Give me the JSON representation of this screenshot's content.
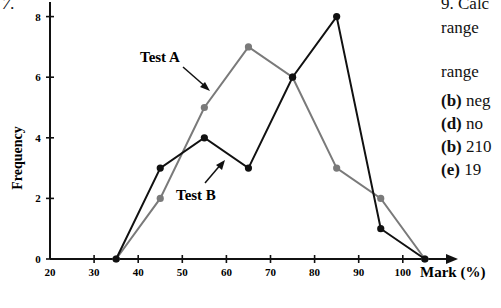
{
  "question_number": "7.",
  "side_text": {
    "lines": [
      {
        "text": "9. Calc",
        "top": -6
      },
      {
        "text": "range",
        "top": 18
      },
      {
        "text": "range",
        "top": 62
      },
      {
        "prefix": "(b)",
        "text": " neg",
        "top": 91
      },
      {
        "prefix": "(d)",
        "text": " no",
        "top": 114
      },
      {
        "prefix": "(b)",
        "text": " 210",
        "top": 137
      },
      {
        "prefix": "(e)",
        "text": " 19",
        "top": 160
      }
    ]
  },
  "chart_data": {
    "type": "line",
    "title": "",
    "xlabel": "Mark (%)",
    "ylabel": "Frequency",
    "x": [
      35,
      45,
      55,
      65,
      75,
      85,
      95,
      105
    ],
    "series": [
      {
        "name": "Test A",
        "color": "#7a7a7a",
        "values": [
          0,
          2,
          5,
          7,
          6,
          3,
          2,
          0
        ]
      },
      {
        "name": "Test B",
        "color": "#111111",
        "values": [
          0,
          3,
          4,
          3,
          6,
          8,
          1,
          0
        ]
      }
    ],
    "xticks": [
      20,
      30,
      40,
      50,
      60,
      70,
      80,
      90,
      100
    ],
    "yticks": [
      0,
      2,
      4,
      6,
      8
    ],
    "xlim": [
      20,
      110
    ],
    "ylim": [
      0,
      8.5
    ],
    "grid": false,
    "annotations": [
      {
        "text": "Test A",
        "series": "Test A"
      },
      {
        "text": "Test B",
        "series": "Test B"
      }
    ]
  }
}
